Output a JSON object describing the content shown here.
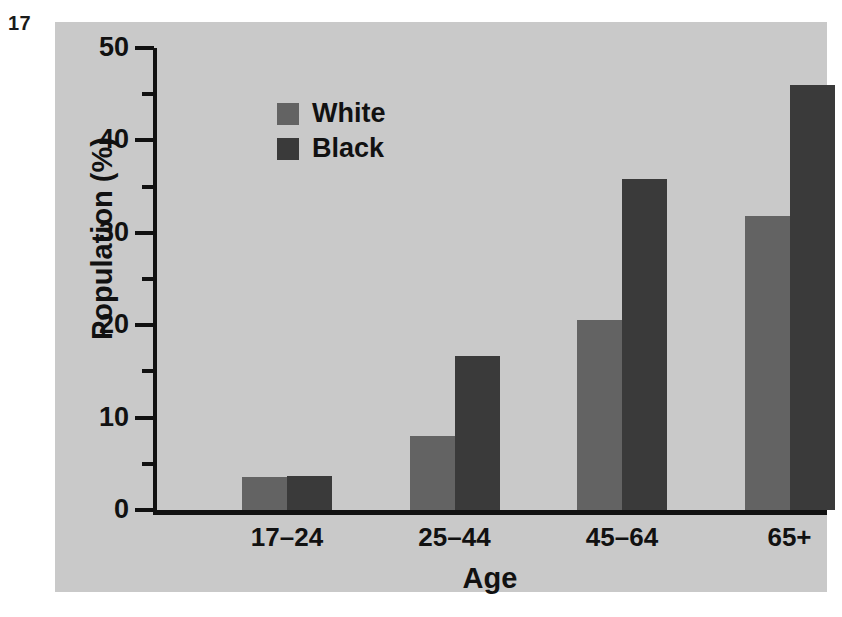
{
  "figure": {
    "number": "17"
  },
  "chart_data": {
    "type": "bar",
    "title": "",
    "xlabel": "Age",
    "ylabel": "Population (%)",
    "categories": [
      "17–24",
      "25–44",
      "45–64",
      "65+"
    ],
    "series": [
      {
        "name": "White",
        "color": "#636363",
        "values": [
          3.6,
          8.0,
          20.6,
          31.8
        ]
      },
      {
        "name": "Black",
        "color": "#3a3a3a",
        "values": [
          3.7,
          16.7,
          35.8,
          46.0
        ]
      }
    ],
    "ylim": [
      0,
      50
    ],
    "yticks": [
      0,
      10,
      20,
      30,
      40,
      50
    ],
    "ytick_labels": [
      "0",
      "10",
      "20",
      "30",
      "40",
      "50"
    ],
    "yticks_minor": [
      5,
      15,
      25,
      35,
      45
    ],
    "grid": false,
    "legend_position": "upper left",
    "panel_background": "#c9c9c9",
    "axis_color": "#111111"
  }
}
